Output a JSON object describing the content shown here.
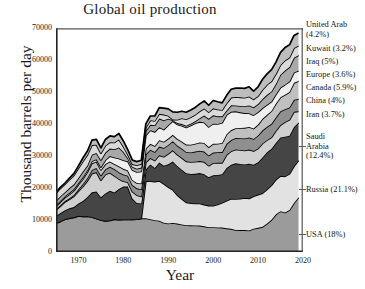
{
  "chart_data": {
    "type": "area",
    "title": "Global oil production",
    "xlabel": "Year",
    "ylabel": "Thousand barrels per day",
    "xlim": [
      1965,
      2020
    ],
    "ylim": [
      0,
      70000
    ],
    "xticks": [
      1970,
      1980,
      1990,
      2000,
      2010,
      2020
    ],
    "yticks": [
      0,
      10000,
      20000,
      30000,
      40000,
      50000,
      60000,
      70000
    ],
    "grid": false,
    "legend_position": "right",
    "stacked": true,
    "note": "Stacked area chart; a discontinuity occurs at 1985 where Russia/USSR data enters the series.",
    "x": [
      1965,
      1966,
      1967,
      1968,
      1969,
      1970,
      1971,
      1972,
      1973,
      1974,
      1975,
      1976,
      1977,
      1978,
      1979,
      1980,
      1981,
      1982,
      1983,
      1984,
      1985,
      1986,
      1987,
      1988,
      1989,
      1990,
      1991,
      1992,
      1993,
      1994,
      1995,
      1996,
      1997,
      1998,
      1999,
      2000,
      2001,
      2002,
      2003,
      2004,
      2005,
      2006,
      2007,
      2008,
      2009,
      2010,
      2011,
      2012,
      2013,
      2014,
      2015,
      2016,
      2017,
      2018,
      2019
    ],
    "series": [
      {
        "name": "USA",
        "label": "USA (18%)",
        "percent": "18%",
        "color": "#9b9b9b",
        "values": [
          9014,
          9579,
          10219,
          10600,
          10828,
          11297,
          11156,
          11185,
          10946,
          10461,
          10007,
          9736,
          9863,
          10274,
          10136,
          10170,
          10181,
          10199,
          10247,
          10509,
          10580,
          10231,
          9944,
          9765,
          9159,
          8914,
          9076,
          8868,
          8583,
          8389,
          8322,
          8295,
          8269,
          8011,
          7731,
          7733,
          7669,
          7626,
          7400,
          7228,
          6895,
          6841,
          6860,
          6734,
          7263,
          7552,
          7868,
          8905,
          10073,
          11767,
          12773,
          12366,
          13135,
          15311,
          17045
        ]
      },
      {
        "name": "Russia",
        "label": "Russia (21.1%)",
        "percent": "21.1%",
        "color": "#e2e2e2",
        "values": [
          0,
          0,
          0,
          0,
          0,
          0,
          0,
          0,
          0,
          0,
          0,
          0,
          0,
          0,
          0,
          0,
          0,
          0,
          0,
          0,
          11584,
          11895,
          12075,
          12489,
          12146,
          11406,
          10405,
          8930,
          8036,
          7132,
          6931,
          6875,
          6898,
          6814,
          6771,
          6752,
          7194,
          7772,
          8653,
          9407,
          9692,
          9801,
          10044,
          10030,
          10139,
          10385,
          10525,
          10643,
          10806,
          10880,
          11023,
          11266,
          11322,
          11480,
          11540
        ]
      },
      {
        "name": "Saudi Arabia",
        "label": "Saudi Arabia (12.4%)",
        "percent": "12.4%",
        "color": "#454545",
        "values": [
          2219,
          2603,
          2810,
          3044,
          3216,
          3851,
          4769,
          6025,
          7693,
          8480,
          7075,
          8577,
          9245,
          8301,
          9532,
          10270,
          10264,
          6483,
          5086,
          4663,
          3601,
          5208,
          4265,
          5720,
          5651,
          7106,
          8820,
          9098,
          9114,
          9089,
          9141,
          9272,
          9482,
          9502,
          8853,
          9491,
          9222,
          8928,
          10164,
          10638,
          11114,
          10853,
          10449,
          10846,
          9893,
          10075,
          11144,
          11635,
          11393,
          11505,
          12014,
          12406,
          11892,
          12287,
          11832
        ]
      },
      {
        "name": "Iran",
        "label": "Iran (3.7%)",
        "percent": "3.7%",
        "color": "#d0d0d0",
        "values": [
          1908,
          2132,
          2603,
          2840,
          3375,
          3829,
          4539,
          5023,
          5861,
          6022,
          5350,
          5883,
          5663,
          5242,
          3168,
          1662,
          1380,
          2214,
          2438,
          2175,
          2250,
          2035,
          2298,
          2240,
          2810,
          3270,
          3500,
          3553,
          3712,
          3730,
          3744,
          3759,
          3776,
          3855,
          3603,
          3855,
          3795,
          3541,
          4183,
          4248,
          4330,
          4374,
          4400,
          4396,
          4249,
          4352,
          4399,
          3774,
          3589,
          3725,
          3852,
          4598,
          4982,
          4715,
          3535
        ]
      },
      {
        "name": "China",
        "label": "China (4%)",
        "percent": "4%",
        "color": "#8f8f8f",
        "values": [
          227,
          290,
          275,
          320,
          430,
          616,
          794,
          911,
          1090,
          1316,
          1490,
          1670,
          1873,
          2082,
          2122,
          2119,
          2018,
          2049,
          2130,
          2298,
          2512,
          2620,
          2690,
          2730,
          2760,
          2778,
          2828,
          2845,
          2890,
          2939,
          2990,
          3170,
          3211,
          3212,
          3213,
          3252,
          3306,
          3346,
          3406,
          3485,
          3627,
          3684,
          3743,
          3814,
          3805,
          4077,
          4074,
          4155,
          4216,
          4246,
          4309,
          3999,
          3846,
          3798,
          3836
        ]
      },
      {
        "name": "Canada",
        "label": "Canada (5.9%)",
        "percent": "5.9%",
        "color": "#c0c0c0",
        "values": [
          920,
          1014,
          1106,
          1222,
          1310,
          1473,
          1582,
          1829,
          2115,
          1996,
          1735,
          1597,
          1642,
          1598,
          1829,
          1764,
          1622,
          1592,
          1671,
          1774,
          1810,
          1805,
          1876,
          1995,
          1946,
          1971,
          1981,
          2065,
          2189,
          2282,
          2402,
          2472,
          2588,
          2672,
          2604,
          2721,
          2677,
          2858,
          3004,
          3085,
          3041,
          3208,
          3302,
          3243,
          3239,
          3369,
          3608,
          3760,
          4006,
          4291,
          4392,
          4467,
          4831,
          5272,
          5651
        ]
      },
      {
        "name": "Europe",
        "label": "Europe (3.6%)",
        "percent": "3.6%",
        "color": "#efefef",
        "values": [
          400,
          420,
          441,
          465,
          498,
          530,
          592,
          612,
          660,
          720,
          840,
          1210,
          1680,
          2040,
          2430,
          2690,
          2860,
          3100,
          3450,
          3760,
          4060,
          4270,
          4400,
          4060,
          3790,
          4160,
          4290,
          4510,
          4940,
          5340,
          5990,
          6420,
          6450,
          6420,
          6320,
          6310,
          6160,
          6320,
          6080,
          5700,
          5270,
          4880,
          4620,
          4320,
          4170,
          3930,
          3380,
          3130,
          2960,
          2890,
          3060,
          3190,
          3250,
          3210,
          3230
        ]
      },
      {
        "name": "Iraq",
        "label": "Iraq (5%)",
        "percent": "5%",
        "color": "#a8a8a8",
        "values": [
          1313,
          1392,
          1227,
          1504,
          1521,
          1549,
          1694,
          1466,
          2018,
          1971,
          2262,
          2415,
          2348,
          2563,
          3477,
          2658,
          1000,
          1012,
          1005,
          1209,
          1433,
          1690,
          2079,
          2685,
          2897,
          2040,
          305,
          425,
          512,
          553,
          560,
          579,
          1155,
          2150,
          2508,
          2583,
          2385,
          2016,
          1344,
          2030,
          1833,
          1999,
          2145,
          2428,
          2452,
          2490,
          2801,
          3116,
          3141,
          3285,
          3986,
          4424,
          4520,
          4614,
          4779
        ]
      },
      {
        "name": "Kuwait",
        "label": "Kuwait (3.2%)",
        "percent": "3.2%",
        "color": "#dadada",
        "values": [
          2371,
          2480,
          2495,
          2611,
          2796,
          2990,
          3196,
          3283,
          3020,
          2546,
          2084,
          2145,
          1969,
          2131,
          2500,
          1656,
          1125,
          823,
          1067,
          1157,
          1023,
          1417,
          1342,
          1501,
          1784,
          964,
          185,
          1058,
          1852,
          2026,
          2057,
          2067,
          2137,
          2232,
          2085,
          2206,
          2148,
          1995,
          2238,
          2425,
          2643,
          2690,
          2636,
          2783,
          2499,
          2536,
          2918,
          3171,
          3184,
          3092,
          3058,
          3145,
          3025,
          3049,
          2996
        ]
      },
      {
        "name": "United Arab",
        "label": "United Arab (4.2%)",
        "percent": "4.2%",
        "color": "#bdbdbd",
        "values": [
          282,
          360,
          382,
          498,
          600,
          780,
          1060,
          1203,
          1533,
          1679,
          1664,
          1936,
          1999,
          1831,
          1831,
          1709,
          1474,
          1250,
          1149,
          1146,
          1193,
          1330,
          1541,
          1910,
          2035,
          2117,
          2386,
          2327,
          2159,
          2191,
          2233,
          2278,
          2316,
          2345,
          2170,
          2442,
          2389,
          2191,
          2474,
          2622,
          2751,
          2926,
          2948,
          3027,
          2579,
          2865,
          3273,
          3384,
          3646,
          3712,
          3902,
          4020,
          3935,
          3942,
          3994
        ]
      }
    ]
  },
  "legend": [
    {
      "id": "united-arab",
      "lines": [
        "United Arab",
        "(4.2%)"
      ],
      "top": 20
    },
    {
      "id": "kuwait",
      "lines": [
        "Kuwait (3.2%)"
      ],
      "top": 44
    },
    {
      "id": "iraq",
      "lines": [
        "Iraq (5%)"
      ],
      "top": 57
    },
    {
      "id": "europe",
      "lines": [
        "Europe (3.6%)"
      ],
      "top": 70
    },
    {
      "id": "canada",
      "lines": [
        "Canada (5.9%)"
      ],
      "top": 83
    },
    {
      "id": "china",
      "lines": [
        "China (4%)"
      ],
      "top": 96
    },
    {
      "id": "iran",
      "lines": [
        "Iran (3.7%)"
      ],
      "top": 110
    },
    {
      "id": "saudi-arabia",
      "lines": [
        "Saudi",
        "Arabia",
        "(12.4%)"
      ],
      "top": 132
    },
    {
      "id": "russia",
      "lines": [
        "Russia (21.1%)"
      ],
      "top": 185
    },
    {
      "id": "usa",
      "lines": [
        "USA (18%)"
      ],
      "top": 230
    }
  ]
}
